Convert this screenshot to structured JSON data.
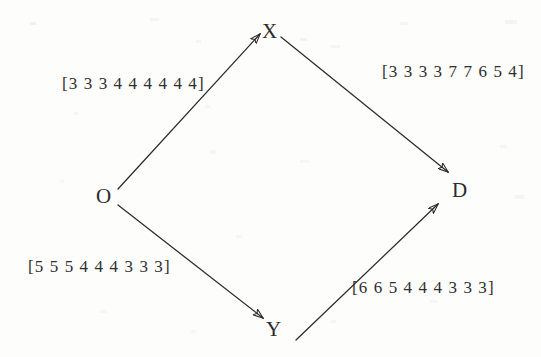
{
  "diagram": {
    "type": "directed-graph",
    "shape": "diamond",
    "background_color": "#fdfdfc",
    "ink_color": "#2b2b2b",
    "nodes": [
      {
        "id": "O",
        "label": "O",
        "x": 103,
        "y": 196,
        "role": "origin"
      },
      {
        "id": "X",
        "label": "X",
        "x": 269,
        "y": 32,
        "role": "intermediate-upper"
      },
      {
        "id": "Y",
        "label": "Y",
        "x": 272,
        "y": 330,
        "role": "intermediate-lower"
      },
      {
        "id": "D",
        "label": "D",
        "x": 459,
        "y": 190,
        "role": "destination"
      }
    ],
    "edges": [
      {
        "id": "O-X",
        "from": "O",
        "to": "X",
        "label": "[3 3 3 4 4 4 4 4 4]",
        "values": [
          3,
          3,
          3,
          4,
          4,
          4,
          4,
          4,
          4
        ],
        "label_x": 62,
        "label_y": 75,
        "x1": 118,
        "y1": 189,
        "x2": 260,
        "y2": 34
      },
      {
        "id": "X-D",
        "from": "X",
        "to": "D",
        "label": "[3 3 3 3 7 7 6 5 4]",
        "values": [
          3,
          3,
          3,
          3,
          7,
          7,
          6,
          5,
          4
        ],
        "label_x": 382,
        "label_y": 63,
        "x1": 281,
        "y1": 37,
        "x2": 448,
        "y2": 172
      },
      {
        "id": "O-Y",
        "from": "O",
        "to": "Y",
        "label": "[5 5 5 4 4 4 3 3 3]",
        "values": [
          5,
          5,
          5,
          4,
          4,
          4,
          3,
          3,
          3
        ],
        "label_x": 28,
        "label_y": 258,
        "x1": 118,
        "y1": 205,
        "x2": 263,
        "y2": 318
      },
      {
        "id": "Y-D",
        "from": "Y",
        "to": "D",
        "label": "[6 6 5 4 4 4 3 3 3]",
        "values": [
          6,
          6,
          5,
          4,
          4,
          4,
          3,
          3,
          3
        ],
        "label_x": 352,
        "label_y": 279,
        "x1": 296,
        "y1": 340,
        "x2": 438,
        "y2": 204
      }
    ]
  }
}
